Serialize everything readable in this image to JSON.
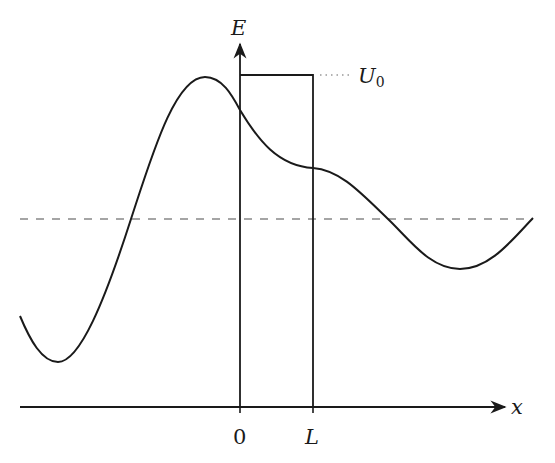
{
  "diagram": {
    "title": "",
    "axes": {
      "y_label": "E",
      "x_label": "x"
    },
    "ticks": {
      "origin": "0",
      "barrier_end": "L"
    },
    "barrier": {
      "label_main": "U",
      "label_sub": "0",
      "left": "0",
      "right": "L"
    },
    "energy_level": {
      "style": "dashed",
      "color": "#888888"
    },
    "wavefunction": {
      "description": "oscillating wave crossing a rectangular potential barrier of height U0 from x=0 to x=L"
    },
    "colors": {
      "ink": "#1a1a1a",
      "dashed": "#888888",
      "dotted": "#999999"
    }
  }
}
